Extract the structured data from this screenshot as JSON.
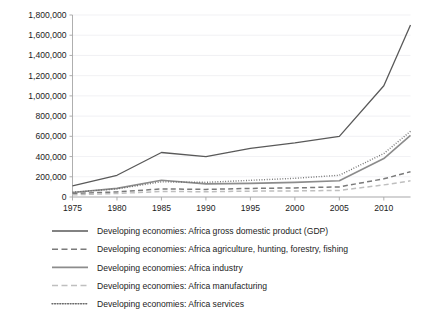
{
  "chart_data": {
    "type": "line",
    "title": "",
    "xlabel": "",
    "ylabel": "",
    "xlim": [
      1975,
      2013
    ],
    "ylim": [
      0,
      1800000
    ],
    "grid": true,
    "legend_position": "bottom",
    "x_ticks": [
      "1975",
      "1980",
      "1985",
      "1990",
      "1995",
      "2000",
      "2005",
      "2010"
    ],
    "x_tick_values": [
      1975,
      1980,
      1985,
      1990,
      1995,
      2000,
      2005,
      2010
    ],
    "y_ticks": [
      "0",
      "200,000",
      "400,000",
      "600,000",
      "800,000",
      "1,000,000",
      "1,200,000",
      "1,400,000",
      "1,600,000",
      "1,800,000"
    ],
    "y_tick_values": [
      0,
      200000,
      400000,
      600000,
      800000,
      1000000,
      1200000,
      1400000,
      1600000,
      1800000
    ],
    "x": [
      1975,
      1980,
      1985,
      1990,
      1995,
      2000,
      2005,
      2010,
      2013
    ],
    "series": [
      {
        "name": "Developing economies: Africa gross domestic product (GDP)",
        "style": "solid",
        "color": "#595959",
        "width": 1.3,
        "values": [
          110000,
          215000,
          440000,
          400000,
          480000,
          535000,
          600000,
          1100000,
          1700000
        ]
      },
      {
        "name": "Developing economies: Africa agriculture, hunting, forestry, fishing",
        "style": "dashed",
        "color": "#7a7a7a",
        "width": 1.5,
        "values": [
          35000,
          50000,
          80000,
          75000,
          85000,
          90000,
          100000,
          180000,
          250000
        ]
      },
      {
        "name": "Developing economies: Africa industry",
        "style": "solid",
        "color": "#8c8c8c",
        "width": 1.6,
        "values": [
          45000,
          85000,
          165000,
          130000,
          135000,
          145000,
          160000,
          380000,
          610000
        ]
      },
      {
        "name": "Developing economies: Africa manufacturing",
        "style": "dashed",
        "color": "#bfbfbf",
        "width": 1.5,
        "values": [
          22000,
          35000,
          55000,
          52000,
          58000,
          60000,
          65000,
          120000,
          160000
        ]
      },
      {
        "name": "Developing economies: Africa services",
        "style": "dotted",
        "color": "#6b6b6b",
        "width": 1.4,
        "values": [
          48000,
          80000,
          150000,
          145000,
          165000,
          185000,
          215000,
          430000,
          650000
        ]
      }
    ]
  },
  "legend": {
    "items": [
      {
        "label": "Developing economies: Africa gross domestic product (GDP)",
        "style": "solid",
        "color": "#595959",
        "width": 1.3
      },
      {
        "label": "Developing economies: Africa agriculture, hunting, forestry, fishing",
        "style": "dashed",
        "color": "#7a7a7a",
        "width": 1.5
      },
      {
        "label": "Developing economies: Africa industry",
        "style": "solid",
        "color": "#8c8c8c",
        "width": 1.6
      },
      {
        "label": "Developing economies: Africa manufacturing",
        "style": "dashed",
        "color": "#bfbfbf",
        "width": 1.5
      },
      {
        "label": "Developing economies: Africa services",
        "style": "dotted",
        "color": "#6b6b6b",
        "width": 1.4
      }
    ]
  },
  "style": {
    "grid_color": "#e8e8ec",
    "axis_color": "#a6a6a6",
    "text_color": "#1c1c1c",
    "background": "#ffffff"
  }
}
